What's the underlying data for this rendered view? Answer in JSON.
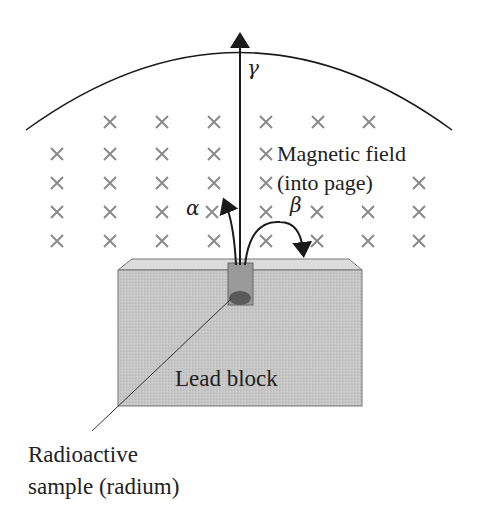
{
  "diagram": {
    "labels": {
      "gamma": "γ",
      "alpha": "α",
      "beta": "β",
      "field_line1": "Magnetic field",
      "field_line2": "(into page)",
      "block": "Lead block",
      "sample_line1": "Radioactive",
      "sample_line2": "sample (radium)"
    },
    "field_symbol": "×",
    "colors": {
      "line": "#1a1a1a",
      "cross": "#8a8a8a",
      "block_front": "#c4c4c4",
      "block_top": "#dedede",
      "sample": "#6a6a6a"
    }
  }
}
